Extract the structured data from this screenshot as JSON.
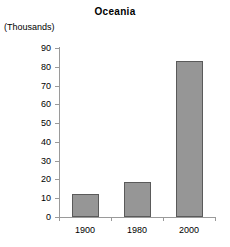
{
  "chart_data": {
    "type": "bar",
    "title": "Oceania",
    "unit_label": "(Thousands)",
    "xlabel": "",
    "ylabel": "",
    "categories": [
      "1900",
      "1980",
      "2000"
    ],
    "values": [
      12,
      18.5,
      83
    ],
    "ylim": [
      0,
      90
    ],
    "ytick_labels": [
      "0",
      "10",
      "20",
      "30",
      "40",
      "50",
      "60",
      "70",
      "80",
      "90"
    ],
    "ytick_values": [
      0,
      10,
      20,
      30,
      40,
      50,
      60,
      70,
      80,
      90
    ],
    "grid": false,
    "legend": "none",
    "series": [
      {
        "name": "Oceania",
        "values": [
          12,
          18.5,
          83
        ]
      }
    ],
    "colors": {
      "bar_fill": "#969696",
      "bar_border": "#5a5a5a",
      "axis": "#9a9a9a",
      "text": "#000000",
      "background": "#ffffff"
    }
  }
}
